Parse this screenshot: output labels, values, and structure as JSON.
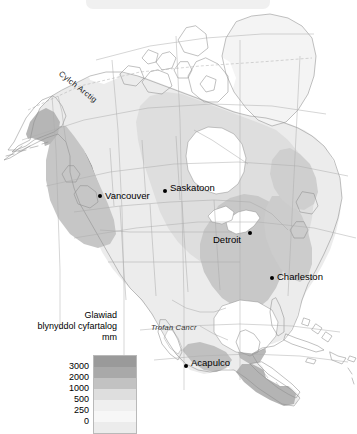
{
  "figure": {
    "kind": "thematic-map",
    "region": "North America",
    "language": "cy"
  },
  "legend": {
    "title_line1": "Glawiad",
    "title_line2": "blynyddol cyfartalog",
    "unit_label": "mm",
    "ticks": [
      "3000",
      "2000",
      "1000",
      "500",
      "250",
      "0"
    ],
    "classes": [
      {
        "label": "3000+",
        "color": "#9a9a9a"
      },
      {
        "label": "2000-3000",
        "color": "#a9a9a9"
      },
      {
        "label": "1000-2000",
        "color": "#c2c2c2"
      },
      {
        "label": "500-1000",
        "color": "#dedede"
      },
      {
        "label": "250-500",
        "color": "#efefef"
      },
      {
        "label": "0-250",
        "color": "#f7f7f7"
      },
      {
        "label": "below 0",
        "color": "#ececec"
      }
    ]
  },
  "cities": [
    {
      "name": "Vancouver",
      "label_x": 108,
      "label_y": 197,
      "dot_x": 98,
      "dot_y": 196
    },
    {
      "name": "Saskatoon",
      "label_x": 172,
      "label_y": 186,
      "dot_x": 164,
      "dot_y": 190
    },
    {
      "name": "Detroit",
      "label_x": 215,
      "label_y": 234,
      "dot_x": 249,
      "dot_y": 232
    },
    {
      "name": "Charleston",
      "label_x": 275,
      "label_y": 275,
      "dot_x": 272,
      "dot_y": 277
    },
    {
      "name": "Acapulco",
      "label_x": 190,
      "label_y": 361,
      "dot_x": 185,
      "dot_y": 365
    }
  ],
  "graticule_labels": {
    "arctic_circle": "Cylch Arctig",
    "tropic_of_cancer": "Trofan Cancr"
  },
  "colors": {
    "background": "#ffffff",
    "ocean": "#ffffff",
    "coastline": "#8f8f8f",
    "border": "#a8a8a8",
    "graticule": "#b0b0b0",
    "top_bar": "#f0f0f0",
    "text": "#000000"
  }
}
